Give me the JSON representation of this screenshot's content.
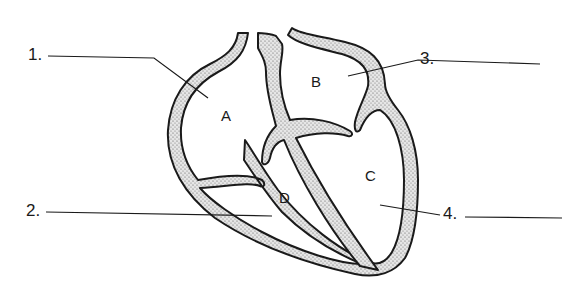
{
  "diagram": {
    "colors": {
      "outline": "#1a1a1a",
      "wall_fill": "#cfcfcf",
      "background": "#ffffff"
    },
    "chambers": [
      {
        "id": "A",
        "label": "A"
      },
      {
        "id": "B",
        "label": "B"
      },
      {
        "id": "C",
        "label": "C"
      },
      {
        "id": "D",
        "label": "D"
      }
    ],
    "callouts": [
      {
        "number": "1.",
        "blank": ""
      },
      {
        "number": "2.",
        "blank": ""
      },
      {
        "number": "3.",
        "blank": ""
      },
      {
        "number": "4.",
        "blank": ""
      }
    ]
  }
}
